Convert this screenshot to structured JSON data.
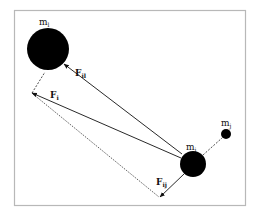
{
  "diagram": {
    "type": "force vector diagram",
    "bodies": [
      {
        "id": "m_l",
        "label": "m",
        "subscript": "l",
        "cx": 48,
        "cy": 49,
        "r": 21
      },
      {
        "id": "m_i",
        "label": "m",
        "subscript": "i",
        "cx": 193,
        "cy": 164,
        "r": 13
      },
      {
        "id": "m_j",
        "label": "m",
        "subscript": "j",
        "cx": 226,
        "cy": 134,
        "r": 5
      }
    ],
    "forces": [
      {
        "id": "F_il",
        "label": "F",
        "subscript": "il",
        "style": "solid arrow"
      },
      {
        "id": "F_i",
        "label": "F",
        "subscript": "i",
        "style": "solid arrow"
      },
      {
        "id": "F_ij",
        "label": "F",
        "subscript": "ij",
        "style": "solid arrow"
      }
    ],
    "labels": {
      "m_l": {
        "main": "m",
        "sub": "l"
      },
      "m_i": {
        "main": "m",
        "sub": "i"
      },
      "m_j": {
        "main": "m",
        "sub": "j"
      },
      "F_il": {
        "main": "F",
        "sub": "il"
      },
      "F_i": {
        "main": "F",
        "sub": "i"
      },
      "F_ij": {
        "main": "F",
        "sub": "ij"
      }
    },
    "colors": {
      "body": "#000000",
      "line": "#222222",
      "frame": "#b8b8b8"
    }
  }
}
